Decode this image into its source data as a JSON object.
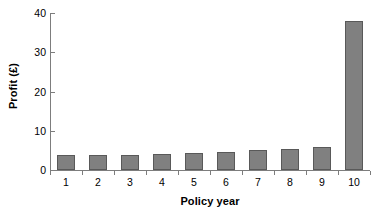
{
  "chart_data": {
    "type": "bar",
    "title": "",
    "xlabel": "Policy year",
    "ylabel": "Profit (£)",
    "categories": [
      "1",
      "2",
      "3",
      "4",
      "5",
      "6",
      "7",
      "8",
      "9",
      "10"
    ],
    "values": [
      3.7,
      3.7,
      3.9,
      4.1,
      4.3,
      4.7,
      5.0,
      5.4,
      5.9,
      38.0
    ],
    "ylim": [
      0,
      40
    ],
    "yticks": [
      0,
      10,
      20,
      30,
      40
    ],
    "ytick_labels": [
      "0",
      "10",
      "20",
      "30",
      "40"
    ],
    "xlim": [
      0,
      10
    ],
    "grid": false,
    "legend": null,
    "series_color": "#808080",
    "series_border_color": "#595959",
    "axis_color": "#7d7d7d",
    "background": "#ffffff"
  }
}
